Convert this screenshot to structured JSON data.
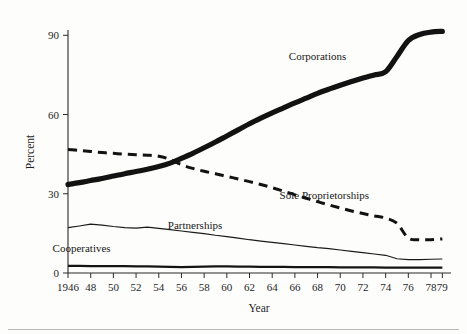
{
  "chart_data": {
    "type": "line",
    "title": "",
    "subtitle": "",
    "xlabel": "Year",
    "ylabel": "Percent",
    "xlim": [
      1946,
      1979
    ],
    "ylim": [
      0,
      92
    ],
    "grid": false,
    "legend_position": "inline-annotations",
    "x_tick_labels": [
      "1946",
      "48",
      "50",
      "52",
      "54",
      "56",
      "58",
      "60",
      "62",
      "64",
      "66",
      "68",
      "70",
      "72",
      "74",
      "76",
      "78",
      "79"
    ],
    "x_tick_values": [
      1946,
      1948,
      1950,
      1952,
      1954,
      1956,
      1958,
      1960,
      1962,
      1964,
      1966,
      1968,
      1970,
      1972,
      1974,
      1976,
      1978,
      1979
    ],
    "y_tick_labels": [
      "0",
      "30",
      "60",
      "90"
    ],
    "y_tick_values": [
      0,
      30,
      60,
      90
    ],
    "x": [
      1946,
      1947,
      1948,
      1949,
      1950,
      1951,
      1952,
      1953,
      1954,
      1955,
      1956,
      1957,
      1958,
      1959,
      1960,
      1961,
      1962,
      1963,
      1964,
      1965,
      1966,
      1967,
      1968,
      1969,
      1970,
      1971,
      1972,
      1973,
      1974,
      1975,
      1976,
      1977,
      1978,
      1979
    ],
    "series": [
      {
        "name": "Corporations",
        "style": "thick-solid",
        "values": [
          33.5,
          34.2,
          35.0,
          35.8,
          36.7,
          37.6,
          38.4,
          39.3,
          40.3,
          41.6,
          43.4,
          45.3,
          47.4,
          49.6,
          51.9,
          54.2,
          56.5,
          58.6,
          60.6,
          62.5,
          64.4,
          66.2,
          68.0,
          69.6,
          71.1,
          72.5,
          73.8,
          75.0,
          76.2,
          82.0,
          88.0,
          90.3,
          91.2,
          91.5
        ]
      },
      {
        "name": "Sole Proprietorships",
        "style": "dashed",
        "values": [
          46.8,
          46.4,
          46.0,
          45.6,
          45.3,
          45.0,
          44.8,
          44.6,
          44.2,
          43.0,
          41.0,
          39.6,
          38.5,
          37.6,
          36.6,
          35.6,
          34.6,
          33.5,
          32.3,
          31.0,
          29.6,
          28.3,
          27.0,
          25.8,
          24.6,
          23.5,
          22.5,
          21.6,
          20.8,
          18.8,
          13.2,
          12.6,
          12.6,
          12.9
        ]
      },
      {
        "name": "Partnerships",
        "style": "thin-solid",
        "values": [
          17.2,
          17.8,
          18.5,
          18.1,
          17.6,
          17.2,
          17.0,
          17.4,
          16.9,
          16.4,
          15.9,
          15.4,
          14.9,
          14.3,
          13.8,
          13.2,
          12.6,
          12.1,
          11.6,
          11.1,
          10.6,
          10.1,
          9.6,
          9.2,
          8.7,
          8.2,
          7.7,
          7.2,
          6.7,
          5.4,
          5.1,
          5.1,
          5.2,
          5.3
        ]
      },
      {
        "name": "Cooperatives",
        "style": "medium-solid",
        "values": [
          2.7,
          2.7,
          2.6,
          2.6,
          2.6,
          2.6,
          2.5,
          2.5,
          2.4,
          2.3,
          2.2,
          2.3,
          2.4,
          2.5,
          2.5,
          2.4,
          2.4,
          2.3,
          2.3,
          2.3,
          2.2,
          2.2,
          2.2,
          2.2,
          2.1,
          2.1,
          2.1,
          2.1,
          2.0,
          2.0,
          2.0,
          2.0,
          2.0,
          2.0
        ]
      }
    ],
    "annotations": [
      {
        "text": "Corporations",
        "x": 1968.0,
        "y": 80.5
      },
      {
        "text": "Sole Proprietorships",
        "x": 1968.6,
        "y": 28.0
      },
      {
        "text": "Partnerships",
        "x": 1957.2,
        "y": 16.5
      },
      {
        "text": "Cooperatives",
        "x": 1947.2,
        "y": 8.0
      }
    ]
  }
}
